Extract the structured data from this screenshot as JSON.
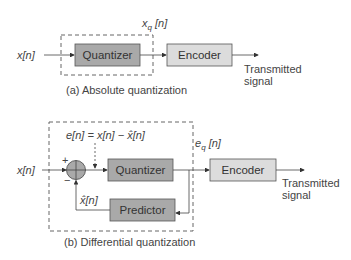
{
  "diagram_a": {
    "input_label": "x[n]",
    "output_label_main": "x",
    "output_label_sub": "q",
    "output_label_rest": " [n]",
    "quantizer_label": "Quantizer",
    "encoder_label": "Encoder",
    "transmitted_line1": "Transmitted",
    "transmitted_line2": "signal",
    "caption": "(a) Absolute quantization"
  },
  "diagram_b": {
    "input_label": "x[n]",
    "error_label": "e[n] = x[n] − x̂[n]",
    "plus_sign": "+",
    "minus_sign": "−",
    "quantized_error_main": "e",
    "quantized_error_sub": "q",
    "quantized_error_rest": " [n]",
    "prediction_label": "x̂[n]",
    "quantizer_label": "Quantizer",
    "predictor_label": "Predictor",
    "encoder_label": "Encoder",
    "transmitted_line1": "Transmitted",
    "transmitted_line2": "signal",
    "caption": "(b) Differential quantization"
  },
  "colors": {
    "quantizer_fill": "#a9a9a9",
    "encoder_fill": "#dcdcdc",
    "line": "#444444"
  }
}
